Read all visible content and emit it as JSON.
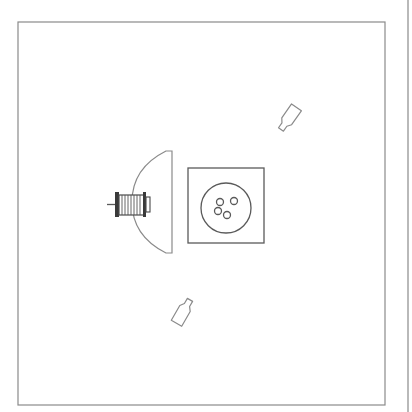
{
  "scene": {
    "kind": "top-down workspace",
    "colors": {
      "background": "#ffffff",
      "stroke": "#8a8a8a",
      "motor": "#5a5a5a"
    },
    "workspace_border": {
      "x": 18,
      "y": 22,
      "width": 367,
      "height": 383
    },
    "side_rule": {
      "x": 408
    },
    "dome": {
      "flat_x": 172,
      "top_y": 151,
      "bottom_y": 253,
      "leftmost_x": 132
    },
    "motor": {
      "shaft_x1": 108,
      "shaft_x2": 117,
      "body_x": 117,
      "body_y": 193,
      "body_w": 28,
      "body_h": 23,
      "ribs": 9
    },
    "tray": {
      "x": 188,
      "y": 168,
      "width": 76,
      "height": 75
    },
    "bowl": {
      "cx": 226,
      "cy": 208,
      "r": 25
    },
    "balls": [
      {
        "cx": 220,
        "cy": 202,
        "r": 3.5
      },
      {
        "cx": 234,
        "cy": 201,
        "r": 3.5
      },
      {
        "cx": 218,
        "cy": 211,
        "r": 3.5
      },
      {
        "cx": 227,
        "cy": 215,
        "r": 3.5
      }
    ],
    "bottles": [
      {
        "name": "bottle-upper-right",
        "cx": 289,
        "cy": 118,
        "rotate": 35
      },
      {
        "name": "bottle-lower-left",
        "cx": 183,
        "cy": 312,
        "rotate": 210
      }
    ]
  }
}
